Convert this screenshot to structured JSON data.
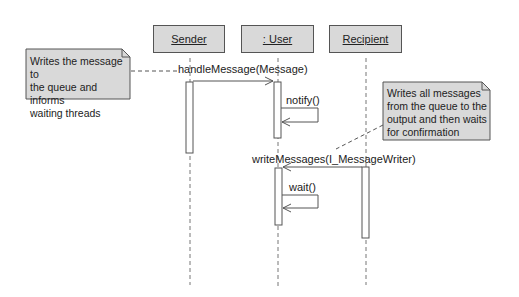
{
  "diagram": {
    "type": "UML sequence diagram",
    "lifelines": [
      {
        "id": "sender",
        "label": "Sender"
      },
      {
        "id": "user",
        "label": ": User"
      },
      {
        "id": "recipient",
        "label": "Recipient"
      }
    ],
    "messages": [
      {
        "label": "handleMessage(Message)",
        "from": "sender",
        "to": "user"
      },
      {
        "label": "notify()",
        "from": "user",
        "to": "user"
      },
      {
        "label": "writeMessages(I_MessageWriter)",
        "from": "recipient",
        "to": "user"
      },
      {
        "label": "wait()",
        "from": "user",
        "to": "user"
      }
    ],
    "notes": [
      {
        "lines": [
          "Writes the message to",
          "the queue and informs",
          "waiting threads"
        ],
        "attached_to": "handleMessage(Message)"
      },
      {
        "lines": [
          "Writes all messages",
          "from the queue to the",
          "output and then waits",
          "for confirmation"
        ],
        "attached_to": "writeMessages(I_MessageWriter)"
      }
    ]
  },
  "colors": {
    "box_fill": "#d9d9d9",
    "line": "#555555",
    "background": "#ffffff"
  }
}
